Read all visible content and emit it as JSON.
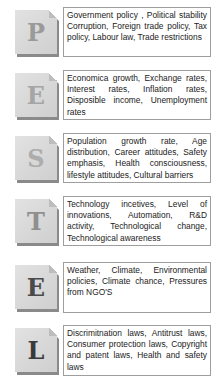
{
  "pestel": [
    {
      "letter": "P",
      "letter_color": "#9a9a9a",
      "top": 10,
      "box_height": 50,
      "text": "Government policy , Political stability Corruption, Foreign trade policy, Tax policy, Labour law, Trade restrictions"
    },
    {
      "letter": "E",
      "letter_color": "#a5a5a5",
      "top": 73,
      "box_height": 50,
      "text": "Economica growth, Exchange rates, Interest rates, Inflation rates, Disposible income, Unemployment rates"
    },
    {
      "letter": "S",
      "letter_color": "#adadad",
      "top": 136,
      "box_height": 50,
      "text": "Population growth rate, Age distribution, Career attitudes, Safety emphasis, Health consciousness, lifestyle attitudes, Cultural barriers"
    },
    {
      "letter": "T",
      "letter_color": "#8f8f8f",
      "top": 199,
      "box_height": 50,
      "text": "Technology incetives, Level of innovations, Automation, R&D activity, Technological change, Technological awareness"
    },
    {
      "letter": "E",
      "letter_color": "#4a4a4a",
      "top": 265,
      "box_height": 51,
      "text": "Weather, Climate, Environmental policies, Climate chance, Pressures from NGO'S"
    },
    {
      "letter": "L",
      "letter_color": "#3a3a3a",
      "top": 328,
      "box_height": 51,
      "text": "Discrimitnation laws, Antitrust laws, Consumer protection laws, Copyright and patent laws, Health and safety laws"
    }
  ]
}
